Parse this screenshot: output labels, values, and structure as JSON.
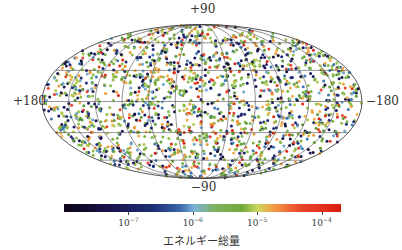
{
  "chart_data": {
    "type": "scatter",
    "projection": "mollweide",
    "title": "",
    "axis_labels": {
      "top": "+90",
      "bottom": "−90",
      "left": "+180",
      "right": "−180"
    },
    "grid": {
      "on": true,
      "latitudes_deg": [
        -60,
        -30,
        0,
        30,
        60
      ],
      "longitudes_deg": [
        -150,
        -120,
        -90,
        -60,
        -30,
        0,
        30,
        60,
        90,
        120,
        150
      ],
      "color": "#4a4a4a"
    },
    "points": {
      "count": 1800,
      "distribution": "uniform on sphere",
      "marker_size_px": 3,
      "value_mix": [
        {
          "range": "~1e-8 to 1e-7 (dark navy)",
          "fraction": 0.22
        },
        {
          "range": "~1e-7 to 1e-6 (blue/teal)",
          "fraction": 0.13
        },
        {
          "range": "~1e-6 to 1e-5 (green/yellow-green)",
          "fraction": 0.43
        },
        {
          "range": "~1e-5 to 1e-4 (orange)",
          "fraction": 0.14
        },
        {
          "range": ">1e-4 (red)",
          "fraction": 0.08
        }
      ]
    },
    "colorbar": {
      "label": "エネルギー総量",
      "scale": "log",
      "ticks": [
        {
          "base": "10",
          "exp": "−7",
          "value": 1e-07
        },
        {
          "base": "10",
          "exp": "−6",
          "value": 1e-06
        },
        {
          "base": "10",
          "exp": "−5",
          "value": 1e-05
        },
        {
          "base": "10",
          "exp": "−4",
          "value": 0.0001
        }
      ],
      "range": [
        1e-08,
        0.0002
      ],
      "position": "bottom",
      "stops": [
        {
          "at": 0.0,
          "color": "#0d0418"
        },
        {
          "at": 0.18,
          "color": "#1a1450"
        },
        {
          "at": 0.32,
          "color": "#1d2f74"
        },
        {
          "at": 0.42,
          "color": "#3a67a8"
        },
        {
          "at": 0.47,
          "color": "#7ab4d6"
        },
        {
          "at": 0.55,
          "color": "#7fb15a"
        },
        {
          "at": 0.64,
          "color": "#6fa83a"
        },
        {
          "at": 0.7,
          "color": "#c8d85a"
        },
        {
          "at": 0.75,
          "color": "#f3a24a"
        },
        {
          "at": 0.85,
          "color": "#e8492a"
        },
        {
          "at": 1.0,
          "color": "#dd1a10"
        }
      ]
    }
  },
  "point_palette": [
    "#1c1a5c",
    "#232e7a",
    "#15123e",
    "#3d78b0",
    "#6fa6c9",
    "#7db44a",
    "#8fbe4e",
    "#5e9d3a",
    "#b5cc4f",
    "#e99a3b",
    "#f0b04c",
    "#e4452c",
    "#d92a18"
  ],
  "point_weights": [
    0.09,
    0.08,
    0.05,
    0.07,
    0.06,
    0.16,
    0.12,
    0.09,
    0.06,
    0.08,
    0.06,
    0.05,
    0.03
  ]
}
